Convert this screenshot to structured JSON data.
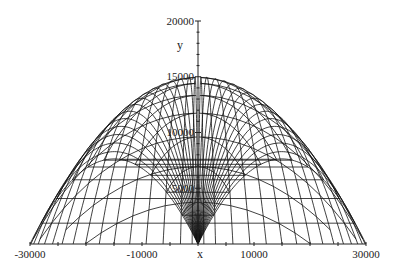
{
  "chart_data": {
    "type": "line",
    "title": "",
    "xlabel": "x",
    "ylabel": "y",
    "xlim": [
      -30000,
      30000
    ],
    "ylim": [
      0,
      20000
    ],
    "grid": false,
    "legend": null,
    "x_ticks": [
      -30000,
      -10000,
      10000,
      30000
    ],
    "x_tick_labels": [
      "-30000",
      "-10000",
      "10000",
      "30000"
    ],
    "y_ticks": [
      5000,
      10000,
      15000,
      20000
    ],
    "y_tick_labels": [
      "5000",
      "10000",
      "15000",
      "20000"
    ],
    "model": {
      "v2_over_g": 30000,
      "angles_deg": [
        45.5,
        48,
        51,
        54,
        57,
        60,
        63,
        66,
        69,
        72,
        75,
        78,
        81,
        84,
        87,
        89
      ],
      "sides": [
        -1,
        1
      ],
      "isochrone_count": 14
    },
    "series_summary": [
      {
        "name": "outermost trajectory",
        "peak_x": 15000,
        "peak_y": 15000,
        "range": 30000
      },
      {
        "name": "near-vertical trajectory",
        "peak_x": 1000,
        "peak_y": 15000,
        "range": 2000
      }
    ]
  },
  "axes": {
    "x_label": "x",
    "y_label": "y"
  }
}
